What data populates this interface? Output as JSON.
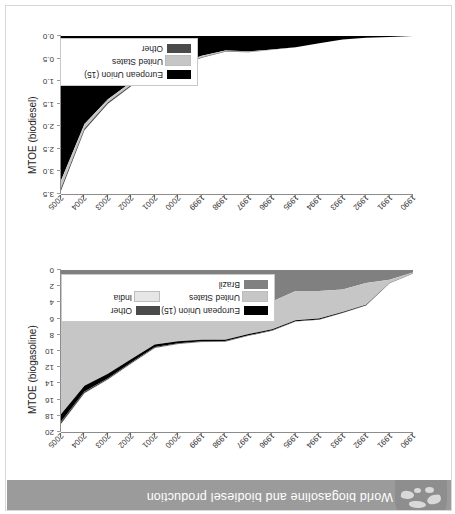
{
  "banner": {
    "title": "World biogasoline and biodiesel production",
    "icon": "globe-icon",
    "background_color": "#9b9b9b",
    "text_color": "#ffffff"
  },
  "colors": {
    "european_union": "#000000",
    "united_states": "#c6c6c6",
    "brazil": "#808080",
    "other": "#4a4a4a",
    "india": "#e6e6e6",
    "axis": "#8c8c8c",
    "frame": "#d8d8d8"
  },
  "chart_data": [
    {
      "id": "biodiesel",
      "type": "area",
      "title": "",
      "xlabel": "",
      "ylabel": "MTOE (biodiesel)",
      "x": [
        1990,
        1991,
        1992,
        1993,
        1994,
        1995,
        1996,
        1997,
        1998,
        1999,
        2000,
        2001,
        2002,
        2003,
        2004,
        2005
      ],
      "xtick_labels": [
        "1990",
        "1991",
        "1992",
        "1993",
        "1994",
        "1995",
        "1996",
        "1997",
        "1998",
        "1999",
        "2000",
        "2001",
        "2002",
        "2003",
        "2004",
        "2005"
      ],
      "ylim": [
        0.0,
        3.5
      ],
      "ytick_labels": [
        "0.0",
        "0.5",
        "1.0",
        "1.5",
        "2.0",
        "2.5",
        "3.0",
        "3.5"
      ],
      "yticks": [
        0.0,
        0.5,
        1.0,
        1.5,
        2.0,
        2.5,
        3.0,
        3.5
      ],
      "grid": false,
      "legend_position": "lower-right",
      "stacked": true,
      "series": [
        {
          "name": "European Union (15)",
          "color": "#000000",
          "values": [
            0.0,
            0.02,
            0.04,
            0.08,
            0.16,
            0.25,
            0.3,
            0.34,
            0.32,
            0.44,
            0.62,
            0.8,
            1.02,
            1.4,
            1.95,
            3.2
          ]
        },
        {
          "name": "United States",
          "color": "#c6c6c6",
          "values": [
            0.0,
            0.0,
            0.0,
            0.0,
            0.0,
            0.0,
            0.01,
            0.01,
            0.02,
            0.03,
            0.04,
            0.05,
            0.06,
            0.07,
            0.1,
            0.17
          ]
        },
        {
          "name": "Other",
          "color": "#4a4a4a",
          "values": [
            0.0,
            0.0,
            0.0,
            0.0,
            0.0,
            0.0,
            0.0,
            0.01,
            0.01,
            0.01,
            0.02,
            0.02,
            0.03,
            0.03,
            0.04,
            0.06
          ]
        }
      ],
      "legend": [
        {
          "label": "European Union (15)",
          "color": "#000000"
        },
        {
          "label": "United States",
          "color": "#c6c6c6"
        },
        {
          "label": "Other",
          "color": "#4a4a4a"
        }
      ]
    },
    {
      "id": "biogasoline",
      "type": "area",
      "title": "",
      "xlabel": "",
      "ylabel": "MTOE (biogasoline)",
      "x": [
        1990,
        1991,
        1992,
        1993,
        1994,
        1995,
        1996,
        1997,
        1998,
        1999,
        2000,
        2001,
        2002,
        2003,
        2004,
        2005
      ],
      "xtick_labels": [
        "1990",
        "1991",
        "1992",
        "1993",
        "1994",
        "1995",
        "1996",
        "1997",
        "1998",
        "1999",
        "2000",
        "2001",
        "2002",
        "2003",
        "2004",
        "2005"
      ],
      "ylim": [
        0,
        20
      ],
      "ytick_labels": [
        "0",
        "2",
        "4",
        "6",
        "8",
        "10",
        "12",
        "14",
        "16",
        "18",
        "20"
      ],
      "yticks": [
        0,
        2,
        4,
        6,
        8,
        10,
        12,
        14,
        16,
        18,
        20
      ],
      "grid": false,
      "legend_position": "lower-right",
      "stacked": true,
      "series": [
        {
          "name": "Brazil",
          "color": "#808080",
          "values": [
            0.3,
            1.2,
            1.6,
            2.4,
            2.6,
            2.6,
            3.9,
            4.3,
            4.7,
            4.6,
            4.7,
            4.4,
            4.9,
            5.8,
            5.6,
            6.2
          ]
        },
        {
          "name": "United States",
          "color": "#c6c6c6",
          "values": [
            0.1,
            0.4,
            2.7,
            2.8,
            3.4,
            3.6,
            3.4,
            3.6,
            3.9,
            4.0,
            4.1,
            4.8,
            6.1,
            7.0,
            8.7,
            11.6
          ]
        },
        {
          "name": "European Union (15)",
          "color": "#000000",
          "values": [
            0.02,
            0.03,
            0.05,
            0.08,
            0.1,
            0.12,
            0.14,
            0.16,
            0.18,
            0.2,
            0.24,
            0.3,
            0.4,
            0.55,
            0.7,
            0.9
          ]
        },
        {
          "name": "Other",
          "color": "#4a4a4a",
          "values": [
            0.01,
            0.01,
            0.02,
            0.03,
            0.04,
            0.05,
            0.06,
            0.07,
            0.08,
            0.09,
            0.1,
            0.12,
            0.15,
            0.18,
            0.22,
            0.3
          ]
        },
        {
          "name": "India",
          "color": "#e6e6e6",
          "values": [
            0.0,
            0.0,
            0.0,
            0.0,
            0.0,
            0.01,
            0.01,
            0.01,
            0.02,
            0.02,
            0.03,
            0.03,
            0.04,
            0.05,
            0.06,
            0.08
          ]
        }
      ],
      "legend": [
        {
          "label": "European Union (15)",
          "color": "#000000"
        },
        {
          "label": "United States",
          "color": "#c6c6c6"
        },
        {
          "label": "Brazil",
          "color": "#808080"
        },
        {
          "label": "Other",
          "color": "#4a4a4a"
        },
        {
          "label": "India",
          "color": "#e6e6e6"
        }
      ]
    }
  ]
}
